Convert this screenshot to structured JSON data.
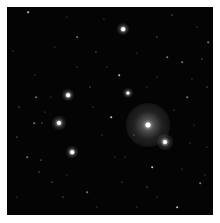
{
  "image": {
    "description": "Astronomical star field with a bright diffuse glowing star cluster core near lower right and scattered point stars on black background",
    "background": "#040404",
    "border": "#ffffff"
  },
  "bright_stars": [
    {
      "x": 141,
      "y": 118,
      "r": 2.5,
      "halo": 22,
      "color": "#ffffff",
      "glow_color": "rgba(200,200,200,0.55)"
    },
    {
      "x": 158,
      "y": 135,
      "r": 2,
      "halo": 8,
      "color": "#ffffff",
      "glow_color": "rgba(220,220,220,0.6)"
    },
    {
      "x": 116,
      "y": 22,
      "r": 1.8,
      "halo": 6,
      "color": "#ffffff",
      "glow_color": "rgba(220,220,220,0.55)"
    },
    {
      "x": 61,
      "y": 88,
      "r": 1.8,
      "halo": 6,
      "color": "#ffffff",
      "glow_color": "rgba(220,220,220,0.55)"
    },
    {
      "x": 121,
      "y": 86,
      "r": 1.6,
      "halo": 5,
      "color": "#ffffff",
      "glow_color": "rgba(220,220,220,0.5)"
    },
    {
      "x": 52,
      "y": 116,
      "r": 2,
      "halo": 7,
      "color": "#ffffff",
      "glow_color": "rgba(220,220,220,0.55)"
    },
    {
      "x": 65,
      "y": 145,
      "r": 1.8,
      "halo": 6,
      "color": "#ffffff",
      "glow_color": "rgba(220,220,220,0.55)"
    }
  ],
  "faint_stars": [
    [
      21,
      5
    ],
    [
      60,
      10
    ],
    [
      97,
      12
    ],
    [
      165,
      8
    ],
    [
      201,
      35
    ],
    [
      6,
      44
    ],
    [
      89,
      45
    ],
    [
      130,
      46
    ],
    [
      175,
      55
    ],
    [
      195,
      52
    ],
    [
      28,
      68
    ],
    [
      70,
      60
    ],
    [
      112,
      68
    ],
    [
      150,
      70
    ],
    [
      185,
      72
    ],
    [
      200,
      80
    ],
    [
      29,
      90
    ],
    [
      44,
      90
    ],
    [
      83,
      80
    ],
    [
      140,
      80
    ],
    [
      180,
      90
    ],
    [
      12,
      100
    ],
    [
      38,
      105
    ],
    [
      86,
      100
    ],
    [
      104,
      110
    ],
    [
      167,
      103
    ],
    [
      187,
      118
    ],
    [
      35,
      116
    ],
    [
      27,
      116
    ],
    [
      95,
      128
    ],
    [
      127,
      128
    ],
    [
      183,
      136
    ],
    [
      20,
      150
    ],
    [
      34,
      153
    ],
    [
      60,
      168
    ],
    [
      108,
      150
    ],
    [
      145,
      160
    ],
    [
      175,
      162
    ],
    [
      198,
      168
    ],
    [
      56,
      190
    ],
    [
      80,
      185
    ],
    [
      115,
      175
    ],
    [
      140,
      180
    ],
    [
      150,
      190
    ],
    [
      193,
      176
    ],
    [
      32,
      165
    ],
    [
      10,
      190
    ],
    [
      130,
      200
    ],
    [
      170,
      200
    ],
    [
      90,
      200
    ],
    [
      48,
      40
    ],
    [
      150,
      30
    ],
    [
      70,
      30
    ],
    [
      190,
      20
    ],
    [
      10,
      130
    ],
    [
      100,
      60
    ],
    [
      160,
      50
    ],
    [
      45,
      175
    ],
    [
      118,
      150
    ],
    [
      200,
      140
    ]
  ]
}
